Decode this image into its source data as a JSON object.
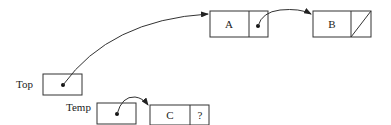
{
  "diagram": {
    "type": "linked-list",
    "pointers": [
      {
        "label": "Top",
        "points_to": "A"
      },
      {
        "label": "Temp",
        "points_to": "C"
      }
    ],
    "nodes": [
      {
        "id": "A",
        "value": "A",
        "next": "B"
      },
      {
        "id": "B",
        "value": "B",
        "next": "null"
      },
      {
        "id": "C",
        "value": "C",
        "next_label": "?"
      }
    ]
  }
}
